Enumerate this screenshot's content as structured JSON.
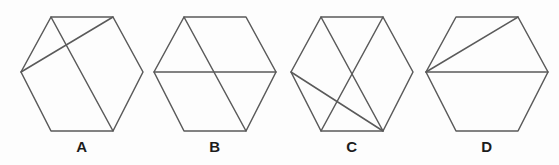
{
  "figure": {
    "type": "geometric-shape-set",
    "background_color": "#fdfdfd",
    "stroke_color": "#5a5a5a",
    "label_color": "#1c1c1c",
    "stroke_width": 1.5,
    "canvas": {
      "width": 559,
      "height": 165
    },
    "shapes": [
      {
        "label": "A",
        "shape": "hexagon",
        "label_x": 82,
        "label_y": 139,
        "center_x": 82,
        "center_y": 72,
        "radius_x": 61,
        "radius_y": 57,
        "vertices": {
          "left": [
            21,
            72
          ],
          "top_left": [
            51,
            17
          ],
          "top_right": [
            113,
            17
          ],
          "right": [
            143,
            72
          ],
          "bottom_right": [
            113,
            131
          ],
          "bottom_left": [
            51,
            131
          ]
        },
        "chords": [
          {
            "from": "top_left",
            "to": "bottom_right"
          },
          {
            "from": "left",
            "to": "top_right"
          }
        ],
        "chord_count": 2
      },
      {
        "label": "B",
        "shape": "hexagon",
        "label_x": 215,
        "label_y": 139,
        "center_x": 215,
        "center_y": 72,
        "radius_x": 61,
        "radius_y": 57,
        "vertices": {
          "left": [
            154,
            72
          ],
          "top_left": [
            184,
            17
          ],
          "top_right": [
            246,
            17
          ],
          "right": [
            276,
            72
          ],
          "bottom_right": [
            246,
            131
          ],
          "bottom_left": [
            184,
            131
          ]
        },
        "chords": [
          {
            "from": "left",
            "to": "right"
          },
          {
            "from": "top_left",
            "to": "bottom_right"
          }
        ],
        "chord_count": 2
      },
      {
        "label": "C",
        "shape": "hexagon",
        "label_x": 352,
        "label_y": 139,
        "center_x": 352,
        "center_y": 72,
        "radius_x": 61,
        "radius_y": 57,
        "vertices": {
          "left": [
            291,
            72
          ],
          "top_left": [
            321,
            17
          ],
          "top_right": [
            383,
            17
          ],
          "right": [
            413,
            72
          ],
          "bottom_right": [
            383,
            131
          ],
          "bottom_left": [
            321,
            131
          ]
        },
        "chords": [
          {
            "from": "top_left",
            "to": "bottom_right"
          },
          {
            "from": "top_right",
            "to": "bottom_left"
          },
          {
            "from": "left",
            "to": "bottom_right"
          }
        ],
        "chord_count": 3
      },
      {
        "label": "D",
        "shape": "hexagon",
        "label_x": 487,
        "label_y": 139,
        "center_x": 487,
        "center_y": 72,
        "radius_x": 61,
        "radius_y": 57,
        "vertices": {
          "left": [
            426,
            72
          ],
          "top_left": [
            456,
            17
          ],
          "top_right": [
            518,
            17
          ],
          "right": [
            548,
            72
          ],
          "bottom_right": [
            518,
            131
          ],
          "bottom_left": [
            456,
            131
          ]
        },
        "chords": [
          {
            "from": "left",
            "to": "right"
          },
          {
            "from": "left",
            "to": "top_right"
          }
        ],
        "chord_count": 2
      }
    ]
  }
}
